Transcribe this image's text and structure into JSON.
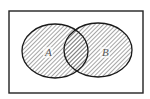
{
  "diagram": {
    "type": "venn",
    "universe": {
      "x": 9,
      "y": 11,
      "width": 134,
      "height": 82,
      "stroke": "#222222"
    },
    "sets": [
      {
        "label": "A",
        "cx": 55,
        "cy": 51,
        "rx": 33,
        "ry": 27,
        "label_x": 47,
        "label_y": 56
      },
      {
        "label": "B",
        "cx": 98,
        "cy": 50,
        "rx": 34,
        "ry": 27,
        "label_x": 103,
        "label_y": 56
      }
    ],
    "shaded_region": "A ∪ B",
    "hatch_color": "#555555",
    "outline_color": "#1a1a1a"
  }
}
